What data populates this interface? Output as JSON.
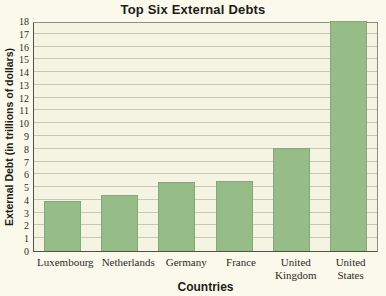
{
  "figure": {
    "title": "Top Six External Debts",
    "xlabel": "Countries",
    "ylabel": "External Debt (in trillions of dollars)"
  },
  "chart_data": {
    "type": "bar",
    "title": "Top Six External Debts",
    "xlabel": "Countries",
    "ylabel": "External Debt (in trillions of dollars)",
    "categories": [
      "Luxembourg",
      "Netherlands",
      "Germany",
      "France",
      "United Kingdom",
      "United States"
    ],
    "values": [
      3.9,
      4.4,
      5.4,
      5.5,
      8.1,
      18
    ],
    "ylim": [
      0,
      18
    ],
    "ytick_step": 1,
    "grid": true,
    "legend": false,
    "colors": {
      "bar": "#96bd87",
      "bar_border": "#83a976",
      "plot_background": "#f5f4e2",
      "page_background": "#fbf9ec",
      "gridline": "#c7c7b6",
      "axis": "#52524a",
      "text": "#1d1d17"
    }
  }
}
